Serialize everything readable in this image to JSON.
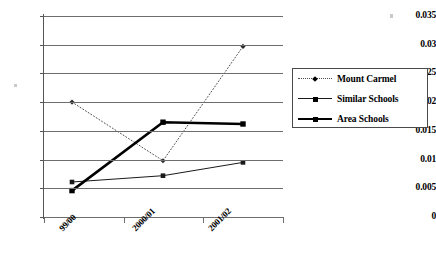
{
  "chart_data": {
    "type": "line",
    "title": "",
    "subtitle": "",
    "xlabel": "",
    "ylabel": "",
    "categories": [
      "99/00",
      "2000/01",
      "2001/02"
    ],
    "ylim": [
      0,
      0.035
    ],
    "ytick_labels": [
      "0.035",
      "0.03",
      "0.025",
      "0.02",
      "0.015",
      "0.01",
      "0.005",
      "0"
    ],
    "ytick_values": [
      0.035,
      0.03,
      0.025,
      0.02,
      0.015,
      0.01,
      0.005,
      0
    ],
    "grid": "horizontal",
    "legend_position": "right",
    "series": [
      {
        "name": "Mount Carmel",
        "values": [
          0.02,
          0.0098,
          0.0297
        ],
        "line_style": "dotted",
        "marker": "diamond",
        "color": "#4c4c4c",
        "line_width": 1
      },
      {
        "name": "Similar Schools",
        "values": [
          0.0061,
          0.0072,
          0.0095
        ],
        "line_style": "solid",
        "marker": "square",
        "color": "#1a1a1a",
        "line_width": 1
      },
      {
        "name": "Area Schools",
        "values": [
          0.0046,
          0.0165,
          0.0162
        ],
        "line_style": "solid",
        "marker": "square",
        "color": "#000000",
        "line_width": 2.6
      }
    ]
  },
  "colors": {
    "gridline": "#6d6d6d",
    "axis": "#555555",
    "background": "#ffffff",
    "text": "#000000",
    "legend_border": "#4a4a4a"
  }
}
